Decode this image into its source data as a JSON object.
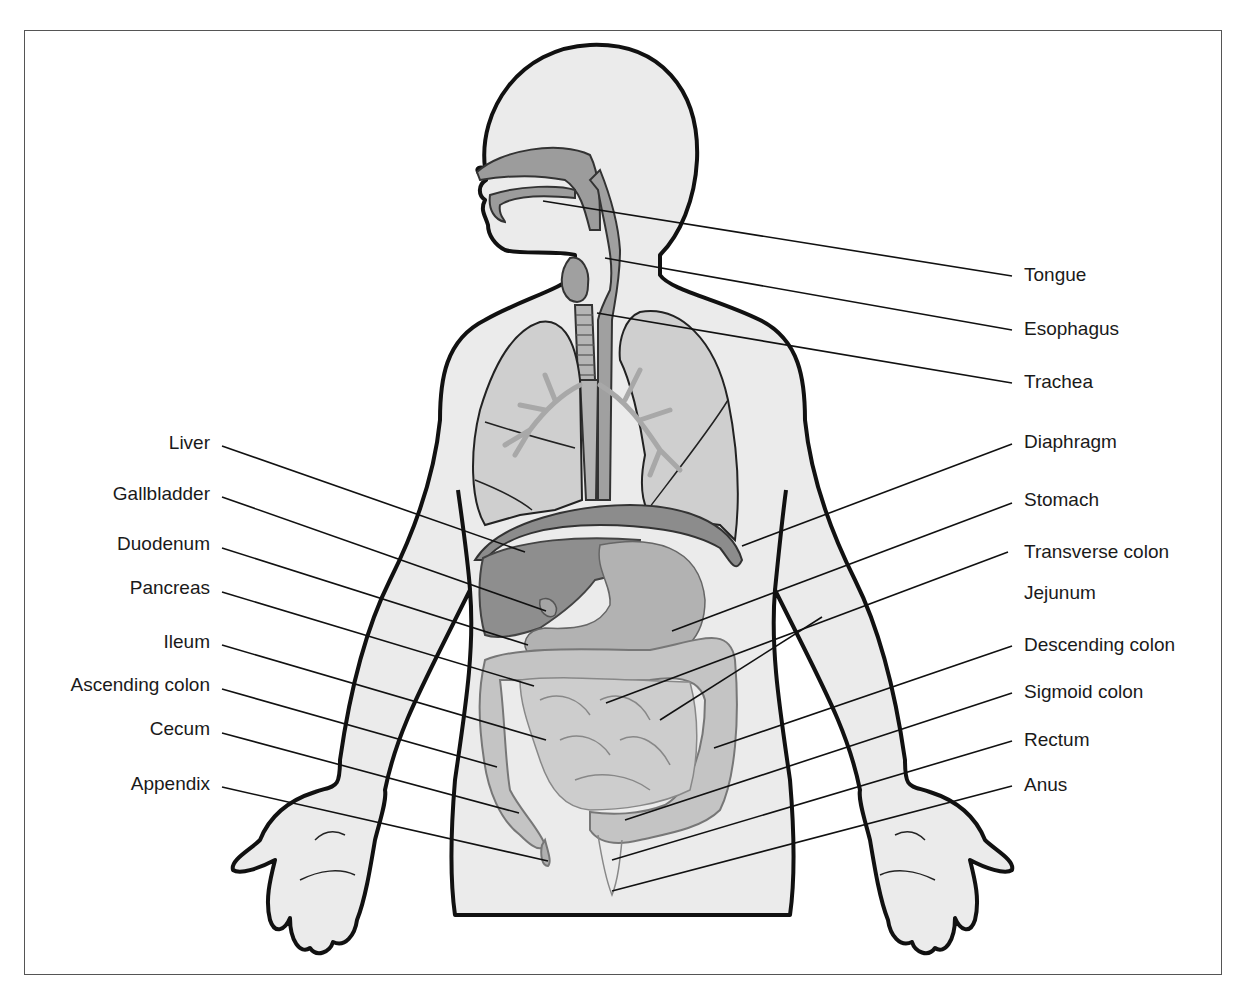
{
  "diagram": {
    "colors": {
      "outline": "#111111",
      "skin": "#ebebeb",
      "organ_dark": "#8a8a8a",
      "organ_mid": "#a9a9a9",
      "organ_light": "#c8c8c8",
      "airway": "#b8b8b8",
      "leader": "#111111",
      "frame": "#555555"
    },
    "labels_left": [
      {
        "text": "Liver",
        "x": 210,
        "y": 443,
        "line": [
          [
            222,
            446
          ],
          [
            525,
            552
          ]
        ]
      },
      {
        "text": "Gallbladder",
        "x": 210,
        "y": 494,
        "line": [
          [
            222,
            497
          ],
          [
            546,
            611
          ]
        ]
      },
      {
        "text": "Duodenum",
        "x": 210,
        "y": 544,
        "line": [
          [
            222,
            548
          ],
          [
            528,
            645
          ]
        ]
      },
      {
        "text": "Pancreas",
        "x": 210,
        "y": 588,
        "line": [
          [
            222,
            592
          ],
          [
            534,
            686
          ]
        ]
      },
      {
        "text": "Ileum",
        "x": 210,
        "y": 642,
        "line": [
          [
            222,
            645
          ],
          [
            546,
            740
          ]
        ]
      },
      {
        "text": "Ascending colon",
        "x": 210,
        "y": 685,
        "line": [
          [
            222,
            689
          ],
          [
            497,
            767
          ]
        ]
      },
      {
        "text": "Cecum",
        "x": 210,
        "y": 729,
        "line": [
          [
            222,
            733
          ],
          [
            519,
            813
          ]
        ]
      },
      {
        "text": "Appendix",
        "x": 210,
        "y": 784,
        "line": [
          [
            222,
            787
          ],
          [
            548,
            861
          ]
        ]
      }
    ],
    "labels_right": [
      {
        "text": "Tongue",
        "x": 1024,
        "y": 275,
        "line": [
          [
            1012,
            276
          ],
          [
            543,
            201
          ]
        ]
      },
      {
        "text": "Esophagus",
        "x": 1024,
        "y": 329,
        "line": [
          [
            1012,
            330
          ],
          [
            605,
            258
          ]
        ]
      },
      {
        "text": "Trachea",
        "x": 1024,
        "y": 382,
        "line": [
          [
            1012,
            383
          ],
          [
            597,
            313
          ]
        ]
      },
      {
        "text": "Diaphragm",
        "x": 1024,
        "y": 442,
        "line": [
          [
            1012,
            444
          ],
          [
            742,
            546
          ]
        ]
      },
      {
        "text": "Stomach",
        "x": 1024,
        "y": 500,
        "line": [
          [
            1012,
            503
          ],
          [
            672,
            631
          ]
        ]
      },
      {
        "text": "Transverse colon",
        "x": 1024,
        "y": 552,
        "line": [
          [
            1008,
            552
          ],
          [
            606,
            703
          ]
        ]
      },
      {
        "text": "Jejunum",
        "x": 1024,
        "y": 593,
        "line": null
      },
      {
        "text": "Descending colon",
        "x": 1024,
        "y": 645,
        "line": [
          [
            1012,
            646
          ],
          [
            714,
            748
          ]
        ]
      },
      {
        "text": "Sigmoid colon",
        "x": 1024,
        "y": 692,
        "line": [
          [
            1012,
            693
          ],
          [
            625,
            820
          ]
        ]
      },
      {
        "text": "Rectum",
        "x": 1024,
        "y": 740,
        "line": [
          [
            1012,
            741
          ],
          [
            612,
            860
          ]
        ]
      },
      {
        "text": "Anus",
        "x": 1024,
        "y": 785,
        "line": [
          [
            1012,
            786
          ],
          [
            612,
            891
          ]
        ]
      }
    ],
    "jejunum_leader": [
      [
        660,
        720
      ],
      [
        822,
        617
      ]
    ],
    "transverse_extra": [
      [
        760,
        620
      ],
      [
        822,
        617
      ]
    ]
  }
}
